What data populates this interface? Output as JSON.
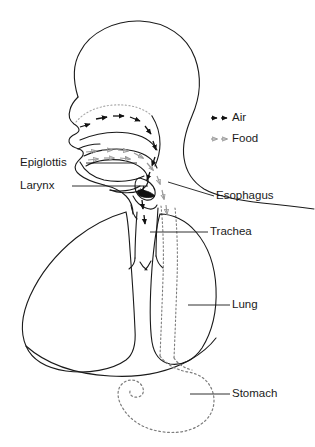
{
  "figure": {
    "outline_color": "#1a1a1a",
    "air_color": "#111111",
    "food_color": "#9a9a9a",
    "background": "#ffffff"
  },
  "labels": {
    "epiglottis": "Epiglottis",
    "larynx": "Larynx",
    "esophagus": "Esophagus",
    "trachea": "Trachea",
    "lung": "Lung",
    "stomach": "Stomach"
  },
  "legend": {
    "air": "Air",
    "food": "Food",
    "air_marker": "solid-arrow-icon",
    "food_marker": "gray-arrow-icon"
  },
  "structures": [
    {
      "name": "head-profile",
      "style": "solid"
    },
    {
      "name": "nasal-cavity",
      "style": "solid"
    },
    {
      "name": "oral-cavity",
      "style": "solid"
    },
    {
      "name": "tongue",
      "style": "solid"
    },
    {
      "name": "epiglottis",
      "style": "solid-filled"
    },
    {
      "name": "larynx",
      "style": "solid"
    },
    {
      "name": "trachea",
      "style": "solid"
    },
    {
      "name": "esophagus",
      "style": "dotted"
    },
    {
      "name": "left-lung",
      "style": "solid"
    },
    {
      "name": "right-lung",
      "style": "solid"
    },
    {
      "name": "diaphragm",
      "style": "solid"
    },
    {
      "name": "stomach",
      "style": "dotted"
    }
  ]
}
